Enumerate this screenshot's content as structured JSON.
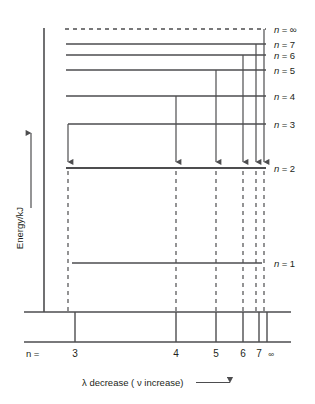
{
  "figure": {
    "type": "energy-level-diagram",
    "title": "",
    "axes": {
      "y": {
        "label": "Energy/kJ",
        "arrow_direction": "up",
        "x_px": 44,
        "top_px": 28,
        "bottom_px": 312
      },
      "x": {
        "caption_lambda": "λ decrease ( ν increase)",
        "caption_arrow": "⟶",
        "prefix_label": "n =",
        "ticks": [
          {
            "label": "3",
            "x_px": 75
          },
          {
            "label": "4",
            "x_px": 176
          },
          {
            "label": "5",
            "x_px": 216
          },
          {
            "label": "6",
            "x_px": 243
          },
          {
            "label": "7",
            "x_px": 259
          },
          {
            "label": "∞",
            "x_px": 267
          }
        ]
      }
    },
    "levels": [
      {
        "name": "n = ∞",
        "n": "∞",
        "label_n": "n",
        "label_eq": "=",
        "label_val": "∞",
        "y_px": 29,
        "x_start": 65,
        "x_end": 266,
        "dashed": true
      },
      {
        "name": "n = 7",
        "n": "7",
        "label_n": "n",
        "label_eq": "=",
        "label_val": "7",
        "y_px": 44,
        "x_start": 66,
        "x_end": 266,
        "dashed": false
      },
      {
        "name": "n = 6",
        "n": "6",
        "label_n": "n",
        "label_eq": "=",
        "label_val": "6",
        "y_px": 55,
        "x_start": 66,
        "x_end": 266,
        "dashed": false
      },
      {
        "name": "n = 5",
        "n": "5",
        "label_n": "n",
        "label_eq": "=",
        "label_val": "5",
        "y_px": 70,
        "x_start": 66,
        "x_end": 266,
        "dashed": false
      },
      {
        "name": "n = 4",
        "n": "4",
        "label_n": "n",
        "label_eq": "=",
        "label_val": "4",
        "y_px": 96,
        "x_start": 66,
        "x_end": 266,
        "dashed": false
      },
      {
        "name": "n = 3",
        "n": "3",
        "label_n": "n",
        "label_eq": "=",
        "label_val": "3",
        "y_px": 124,
        "x_start": 68,
        "x_end": 266,
        "dashed": false
      },
      {
        "name": "n = 2",
        "n": "2",
        "label_n": "n",
        "label_eq": "=",
        "label_val": "2",
        "y_px": 168,
        "x_start": 66,
        "x_end": 266,
        "dashed": false
      },
      {
        "name": "n = 1",
        "n": "1",
        "label_n": "n",
        "label_eq": "=",
        "label_val": "1",
        "y_px": 263,
        "x_start": 72,
        "x_end": 262,
        "dashed": false
      }
    ],
    "transitions": [
      {
        "name": "transition-3-to-2",
        "from": "3",
        "to": "2",
        "x_px": 68,
        "y_from": 124,
        "y_to": 168
      },
      {
        "name": "transition-4-to-2",
        "from": "4",
        "to": "2",
        "x_px": 176,
        "y_from": 96,
        "y_to": 168
      },
      {
        "name": "transition-5-to-2",
        "from": "5",
        "to": "2",
        "x_px": 216,
        "y_from": 70,
        "y_to": 168
      },
      {
        "name": "transition-6-to-2",
        "from": "6",
        "to": "2",
        "x_px": 243,
        "y_from": 55,
        "y_to": 168
      },
      {
        "name": "transition-7-to-2",
        "from": "7",
        "to": "2",
        "x_px": 256,
        "y_from": 44,
        "y_to": 168
      },
      {
        "name": "transition-inf-to-2",
        "from": "∞",
        "to": "2",
        "x_px": 264,
        "y_from": 29,
        "y_to": 168
      }
    ],
    "drop_lines": [
      {
        "name": "drop-line-3",
        "x_px": 68,
        "y_top": 171,
        "y_bottom": 312
      },
      {
        "name": "drop-line-4",
        "x_px": 176,
        "y_top": 171,
        "y_bottom": 312
      },
      {
        "name": "drop-line-5",
        "x_px": 216,
        "y_top": 171,
        "y_bottom": 312
      },
      {
        "name": "drop-line-6",
        "x_px": 243,
        "y_top": 171,
        "y_bottom": 312
      },
      {
        "name": "drop-line-7",
        "x_px": 256,
        "y_top": 171,
        "y_bottom": 312
      },
      {
        "name": "drop-line-inf",
        "x_px": 264,
        "y_top": 171,
        "y_bottom": 312
      }
    ],
    "spectrum_band": {
      "name": "spectrum-band",
      "top_y_px": 312,
      "bottom_y_px": 342,
      "x_start": 24,
      "x_end": 291,
      "lines": [
        {
          "name": "spectrum-line-3",
          "x_px": 75
        },
        {
          "name": "spectrum-line-4",
          "x_px": 176
        },
        {
          "name": "spectrum-line-5",
          "x_px": 216
        },
        {
          "name": "spectrum-line-6",
          "x_px": 243
        },
        {
          "name": "spectrum-line-7",
          "x_px": 259
        },
        {
          "name": "spectrum-line-inf",
          "x_px": 267
        }
      ]
    },
    "colors": {
      "ink": "#4d4d4f",
      "text": "#231f20",
      "background": "#ffffff"
    }
  }
}
